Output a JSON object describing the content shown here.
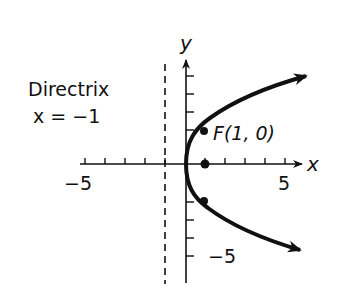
{
  "diagram": {
    "type": "parabola",
    "equation_hint": "y^2 = 4x",
    "directrix": {
      "title": "Directrix",
      "equation": "x = −1",
      "x_value": -1
    },
    "focus": {
      "label": "F(1, 0)",
      "x": 1,
      "y": 0
    },
    "axes": {
      "x_label": "x",
      "y_label": "y",
      "x_tick_labels": [
        {
          "value": -5,
          "text": "−5"
        },
        {
          "value": 5,
          "text": "5"
        }
      ],
      "y_tick_labels": [
        {
          "value": -5,
          "text": "−5"
        }
      ],
      "x_range": [
        -5,
        5
      ],
      "y_range": [
        -5,
        5
      ]
    },
    "points_on_curve": [
      {
        "x": 1,
        "y": 2
      },
      {
        "x": 1,
        "y": -2
      }
    ],
    "colors": {
      "ink": "#111111",
      "background": "#ffffff"
    }
  }
}
